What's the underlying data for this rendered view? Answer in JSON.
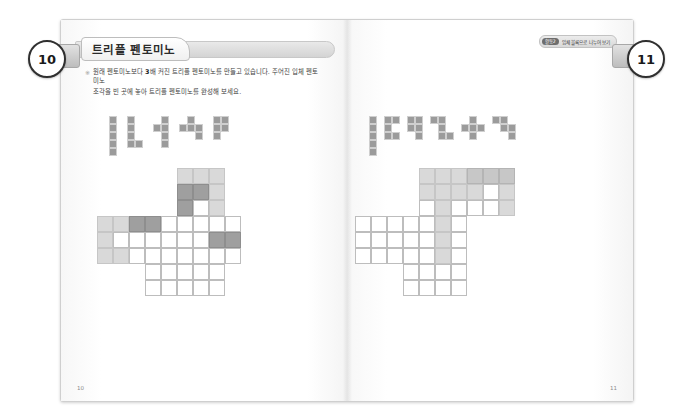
{
  "document": {
    "title": "트리플 펜토미노",
    "unit_badge": {
      "pill": "활동2",
      "text": "입체 블록으로 나누어 보기"
    },
    "intro": {
      "marker": "※",
      "line1_a": "원래 펜토미노보다 ",
      "line1_b": "3",
      "line1_c": "배 커진 트리플 펜토미노를 만들고 있습니다. 주어진 입체 펜토미노",
      "line2": "조각을 빈 곳에 놓아 트리플 펜토미노를 완성해 보세요."
    },
    "folio_left": "10",
    "folio_right": "11",
    "bubble_left": "10",
    "bubble_right": "11"
  },
  "colors": {
    "piece_fill": "#9b9b9b",
    "cell_light": "#d9d9d9",
    "cell_mid": "#c7c7c7",
    "cell_dark": "#9f9f9f",
    "cell_empty": "#ffffff",
    "outline": "#8a8a8a",
    "bubble_border": "#2f2f2f"
  },
  "left_page": {
    "pieces": [
      {
        "name": "I-pentomino",
        "cells": [
          [
            0,
            0
          ],
          [
            0,
            1
          ],
          [
            0,
            2
          ],
          [
            0,
            3
          ],
          [
            0,
            4
          ]
        ]
      },
      {
        "name": "L-pentomino",
        "cells": [
          [
            0,
            0
          ],
          [
            0,
            1
          ],
          [
            0,
            2
          ],
          [
            0,
            3
          ],
          [
            1,
            3
          ]
        ]
      },
      {
        "name": "T-pentomino-rot",
        "cells": [
          [
            1,
            0
          ],
          [
            1,
            1
          ],
          [
            0,
            1
          ],
          [
            1,
            2
          ],
          [
            1,
            3
          ]
        ]
      },
      {
        "name": "S-pentomino",
        "cells": [
          [
            1,
            0
          ],
          [
            0,
            1
          ],
          [
            1,
            1
          ],
          [
            2,
            1
          ],
          [
            2,
            2
          ]
        ]
      },
      {
        "name": "P-pentomino",
        "cells": [
          [
            0,
            0
          ],
          [
            1,
            0
          ],
          [
            0,
            1
          ],
          [
            1,
            1
          ],
          [
            0,
            2
          ]
        ]
      }
    ],
    "grid": {
      "cols": 10,
      "rows": 9,
      "cells": [
        {
          "c": 6,
          "r": 0,
          "s": "light"
        },
        {
          "c": 7,
          "r": 0,
          "s": "light"
        },
        {
          "c": 8,
          "r": 0,
          "s": "light"
        },
        {
          "c": 6,
          "r": 1,
          "s": "dark"
        },
        {
          "c": 7,
          "r": 1,
          "s": "dark"
        },
        {
          "c": 8,
          "r": 1,
          "s": "light"
        },
        {
          "c": 6,
          "r": 2,
          "s": "dark"
        },
        {
          "c": 7,
          "r": 2,
          "s": "empty"
        },
        {
          "c": 8,
          "r": 2,
          "s": "light"
        },
        {
          "c": 1,
          "r": 3,
          "s": "light"
        },
        {
          "c": 2,
          "r": 3,
          "s": "light"
        },
        {
          "c": 3,
          "r": 3,
          "s": "dark"
        },
        {
          "c": 4,
          "r": 3,
          "s": "dark"
        },
        {
          "c": 5,
          "r": 3,
          "s": "empty"
        },
        {
          "c": 6,
          "r": 3,
          "s": "empty"
        },
        {
          "c": 7,
          "r": 3,
          "s": "empty"
        },
        {
          "c": 8,
          "r": 3,
          "s": "empty"
        },
        {
          "c": 9,
          "r": 3,
          "s": "empty"
        },
        {
          "c": 1,
          "r": 4,
          "s": "light"
        },
        {
          "c": 2,
          "r": 4,
          "s": "empty"
        },
        {
          "c": 3,
          "r": 4,
          "s": "empty"
        },
        {
          "c": 4,
          "r": 4,
          "s": "empty"
        },
        {
          "c": 5,
          "r": 4,
          "s": "empty"
        },
        {
          "c": 6,
          "r": 4,
          "s": "empty"
        },
        {
          "c": 7,
          "r": 4,
          "s": "empty"
        },
        {
          "c": 8,
          "r": 4,
          "s": "dark"
        },
        {
          "c": 9,
          "r": 4,
          "s": "dark"
        },
        {
          "c": 1,
          "r": 5,
          "s": "light"
        },
        {
          "c": 2,
          "r": 5,
          "s": "light"
        },
        {
          "c": 3,
          "r": 5,
          "s": "empty"
        },
        {
          "c": 4,
          "r": 5,
          "s": "empty"
        },
        {
          "c": 5,
          "r": 5,
          "s": "empty"
        },
        {
          "c": 6,
          "r": 5,
          "s": "empty"
        },
        {
          "c": 7,
          "r": 5,
          "s": "empty"
        },
        {
          "c": 8,
          "r": 5,
          "s": "empty"
        },
        {
          "c": 9,
          "r": 5,
          "s": "empty"
        },
        {
          "c": 4,
          "r": 6,
          "s": "empty"
        },
        {
          "c": 5,
          "r": 6,
          "s": "empty"
        },
        {
          "c": 6,
          "r": 6,
          "s": "empty"
        },
        {
          "c": 7,
          "r": 6,
          "s": "empty"
        },
        {
          "c": 8,
          "r": 6,
          "s": "empty"
        },
        {
          "c": 4,
          "r": 7,
          "s": "empty"
        },
        {
          "c": 5,
          "r": 7,
          "s": "empty"
        },
        {
          "c": 6,
          "r": 7,
          "s": "empty"
        },
        {
          "c": 7,
          "r": 7,
          "s": "empty"
        },
        {
          "c": 8,
          "r": 7,
          "s": "empty"
        }
      ]
    }
  },
  "right_page": {
    "pieces": [
      {
        "name": "I-pentomino",
        "cells": [
          [
            0,
            0
          ],
          [
            0,
            1
          ],
          [
            0,
            2
          ],
          [
            0,
            3
          ],
          [
            0,
            4
          ]
        ]
      },
      {
        "name": "U-pentomino",
        "cells": [
          [
            0,
            0
          ],
          [
            1,
            0
          ],
          [
            0,
            1
          ],
          [
            0,
            2
          ],
          [
            1,
            2
          ]
        ]
      },
      {
        "name": "P-pentomino",
        "cells": [
          [
            0,
            0
          ],
          [
            1,
            0
          ],
          [
            0,
            1
          ],
          [
            1,
            1
          ],
          [
            1,
            2
          ]
        ]
      },
      {
        "name": "Z-pentomino",
        "cells": [
          [
            0,
            0
          ],
          [
            1,
            0
          ],
          [
            1,
            1
          ],
          [
            1,
            2
          ],
          [
            2,
            2
          ]
        ]
      },
      {
        "name": "X-pentomino",
        "cells": [
          [
            1,
            0
          ],
          [
            0,
            1
          ],
          [
            1,
            1
          ],
          [
            2,
            1
          ],
          [
            1,
            2
          ]
        ]
      },
      {
        "name": "W-pentomino",
        "cells": [
          [
            0,
            0
          ],
          [
            1,
            0
          ],
          [
            1,
            1
          ],
          [
            2,
            1
          ],
          [
            2,
            2
          ]
        ]
      }
    ],
    "grid": {
      "cols": 10,
      "rows": 9,
      "cells": [
        {
          "c": 4,
          "r": 0,
          "s": "light"
        },
        {
          "c": 5,
          "r": 0,
          "s": "light"
        },
        {
          "c": 6,
          "r": 0,
          "s": "light"
        },
        {
          "c": 7,
          "r": 0,
          "s": "mid"
        },
        {
          "c": 8,
          "r": 0,
          "s": "mid"
        },
        {
          "c": 9,
          "r": 0,
          "s": "mid"
        },
        {
          "c": 4,
          "r": 1,
          "s": "light"
        },
        {
          "c": 5,
          "r": 1,
          "s": "light"
        },
        {
          "c": 6,
          "r": 1,
          "s": "light"
        },
        {
          "c": 7,
          "r": 1,
          "s": "light"
        },
        {
          "c": 8,
          "r": 1,
          "s": "empty"
        },
        {
          "c": 9,
          "r": 1,
          "s": "light"
        },
        {
          "c": 4,
          "r": 2,
          "s": "empty"
        },
        {
          "c": 5,
          "r": 2,
          "s": "light"
        },
        {
          "c": 6,
          "r": 2,
          "s": "empty"
        },
        {
          "c": 7,
          "r": 2,
          "s": "empty"
        },
        {
          "c": 8,
          "r": 2,
          "s": "empty"
        },
        {
          "c": 9,
          "r": 2,
          "s": "light"
        },
        {
          "c": 0,
          "r": 3,
          "s": "empty"
        },
        {
          "c": 1,
          "r": 3,
          "s": "empty"
        },
        {
          "c": 2,
          "r": 3,
          "s": "empty"
        },
        {
          "c": 3,
          "r": 3,
          "s": "empty"
        },
        {
          "c": 4,
          "r": 3,
          "s": "empty"
        },
        {
          "c": 5,
          "r": 3,
          "s": "light"
        },
        {
          "c": 6,
          "r": 3,
          "s": "empty"
        },
        {
          "c": 0,
          "r": 4,
          "s": "empty"
        },
        {
          "c": 1,
          "r": 4,
          "s": "empty"
        },
        {
          "c": 2,
          "r": 4,
          "s": "empty"
        },
        {
          "c": 3,
          "r": 4,
          "s": "empty"
        },
        {
          "c": 4,
          "r": 4,
          "s": "empty"
        },
        {
          "c": 5,
          "r": 4,
          "s": "light"
        },
        {
          "c": 6,
          "r": 4,
          "s": "empty"
        },
        {
          "c": 0,
          "r": 5,
          "s": "empty"
        },
        {
          "c": 1,
          "r": 5,
          "s": "empty"
        },
        {
          "c": 2,
          "r": 5,
          "s": "empty"
        },
        {
          "c": 3,
          "r": 5,
          "s": "empty"
        },
        {
          "c": 4,
          "r": 5,
          "s": "empty"
        },
        {
          "c": 5,
          "r": 5,
          "s": "light"
        },
        {
          "c": 6,
          "r": 5,
          "s": "empty"
        },
        {
          "c": 3,
          "r": 6,
          "s": "empty"
        },
        {
          "c": 4,
          "r": 6,
          "s": "empty"
        },
        {
          "c": 5,
          "r": 6,
          "s": "empty"
        },
        {
          "c": 6,
          "r": 6,
          "s": "empty"
        },
        {
          "c": 3,
          "r": 7,
          "s": "empty"
        },
        {
          "c": 4,
          "r": 7,
          "s": "empty"
        },
        {
          "c": 5,
          "r": 7,
          "s": "empty"
        },
        {
          "c": 6,
          "r": 7,
          "s": "empty"
        }
      ]
    }
  }
}
